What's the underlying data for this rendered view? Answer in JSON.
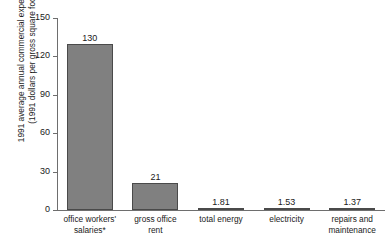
{
  "chart_data": {
    "type": "bar",
    "title": "",
    "subtitle": "",
    "xlabel": "",
    "ylabel_line1": "1991 average annual commercial expenditure",
    "ylabel_line2": "(1991 dollars per gross square foot)",
    "categories": [
      "office workers'\nsalaries*",
      "gross office\nrent",
      "total energy",
      "electricity",
      "repairs and\nmaintenance"
    ],
    "category_lines": [
      [
        "office workers'",
        "salaries*"
      ],
      [
        "gross office",
        "rent"
      ],
      [
        "total energy"
      ],
      [
        "electricity"
      ],
      [
        "repairs and",
        "maintenance"
      ]
    ],
    "values": [
      130,
      21,
      1.81,
      1.53,
      1.37
    ],
    "value_labels": [
      "130",
      "21",
      "1.81",
      "1.53",
      "1.37"
    ],
    "ylim": [
      0,
      150
    ],
    "yticks": [
      150,
      120,
      90,
      60,
      30,
      0
    ],
    "ytick_labels": [
      "150",
      "120",
      "90",
      "60",
      "30",
      "0"
    ],
    "grid": false,
    "legend": false,
    "legend_position": "none",
    "bar_color": "#808080",
    "bar_edge_color": "#4a4a4a",
    "axis_color": "#6e6e6e",
    "text_color": "#1a1a1a",
    "background_color": "#ffffff"
  }
}
